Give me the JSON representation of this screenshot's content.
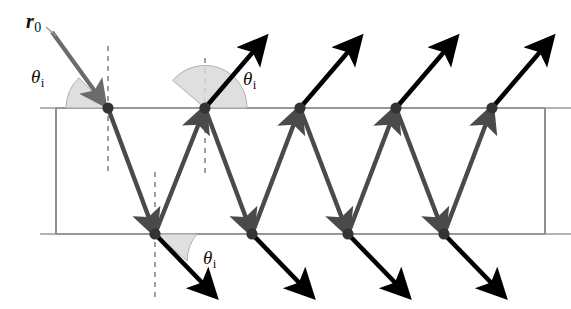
{
  "figure": {
    "colors": {
      "incident_ray": "#6b6b6b",
      "internal_ray": "#4a4a4a",
      "exit_ray": "#000000",
      "node": "#333333",
      "surface_line": "#9a9a9a",
      "slab_edge": "#555555",
      "normal_dash": "#8c8c8c",
      "angle_wedge_fill": "#d9d9d9",
      "angle_wedge_stroke": "#b0b0b0",
      "background": "#ffffff",
      "label_text": "#111111"
    },
    "labels": [
      {
        "id": "r0",
        "symbol": "r",
        "subscript": "0",
        "x": 26,
        "y": 10,
        "style": "bold-italic"
      },
      {
        "id": "theta-incident",
        "symbol": "θ",
        "subscript": "i",
        "x": 31,
        "y": 66,
        "style": "italic"
      },
      {
        "id": "theta-top-reflected",
        "symbol": "θ",
        "subscript": "i",
        "x": 243,
        "y": 68,
        "style": "italic"
      },
      {
        "id": "theta-bottom-transmitted",
        "symbol": "θ",
        "subscript": "i",
        "x": 203,
        "y": 247,
        "style": "italic"
      }
    ],
    "slab": {
      "x": 56,
      "y": 108,
      "width": 489,
      "height": 126
    },
    "surfaces": {
      "top_y": 108,
      "bottom_y": 234,
      "line_left": 40,
      "line_right": 571
    },
    "geometry": {
      "period_x": 96,
      "top_nodes_x": [
        108,
        205,
        300,
        396,
        492
      ],
      "bottom_nodes_x": [
        155,
        252,
        348,
        444
      ],
      "node_radius": 5.6,
      "incident_entry_point": [
        108,
        108
      ],
      "incident_start": [
        52,
        32
      ],
      "exit_ray_length": 78,
      "exit_ray_angle_deg": 40
    },
    "annotations": {
      "incidence_angle_name": "angle of incidence",
      "reflection_angle_name": "angle of reflection",
      "transmission_angle_name": "transmitted ray angle"
    }
  }
}
